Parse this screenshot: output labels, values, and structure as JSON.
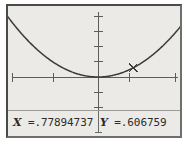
{
  "device": {
    "name": "graphing-calculator-screen",
    "screen_bg": "#eceae6",
    "ink_color": "#4a4a4a"
  },
  "trace": {
    "x_var": "X",
    "x_eq": " =",
    "x_value": ".77894737",
    "y_var": "Y",
    "y_eq": " =",
    "y_value": ".606759"
  },
  "chart_data": {
    "type": "line",
    "title": "",
    "xlabel": "",
    "ylabel": "",
    "curve": "parabola opening upward with vertex at the origin",
    "function": "y = x^2",
    "xlim": [
      -2.1,
      1.85
    ],
    "ylim": [
      -1.55,
      2.05
    ],
    "grid": false,
    "legend": "none",
    "axes": {
      "x_axis_pixel_y": 71,
      "y_axis_pixel_x": 90,
      "x_tick_spacing_px": 45,
      "y_tick_spacing_px": 15,
      "x_ticks_px": [
        0,
        45,
        90,
        135,
        170
      ],
      "y_ticks_px": [
        11,
        26,
        41,
        56,
        71,
        86,
        101
      ]
    },
    "x": [
      -2.1,
      -1.9,
      -1.7,
      -1.5,
      -1.3,
      -1.1,
      -0.9,
      -0.7,
      -0.5,
      -0.3,
      -0.1,
      0.0,
      0.1,
      0.3,
      0.5,
      0.7,
      0.9,
      1.1,
      1.3,
      1.5,
      1.7,
      1.85
    ],
    "values": [
      4.41,
      3.61,
      2.89,
      2.25,
      1.69,
      1.21,
      0.81,
      0.49,
      0.25,
      0.09,
      0.01,
      0.0,
      0.01,
      0.09,
      0.25,
      0.49,
      0.81,
      1.21,
      1.69,
      2.25,
      2.89,
      3.42
    ],
    "cursor": {
      "label": "trace-cursor",
      "x": 0.77894737,
      "y": 0.606759,
      "pixel_x": 123,
      "pixel_y": 61,
      "glyph": "x"
    }
  }
}
